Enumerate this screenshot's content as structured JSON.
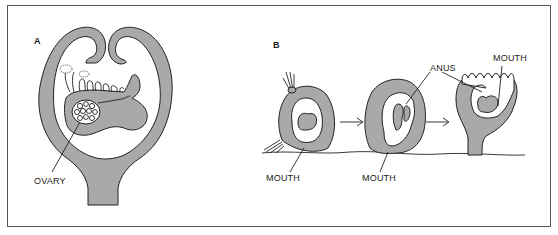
{
  "figure": {
    "panels": [
      {
        "id": "A",
        "label": "A",
        "subject": "sessile organism, cross-section with body cavity",
        "labels": [
          {
            "text": "OVARY"
          }
        ]
      },
      {
        "id": "B",
        "label": "B",
        "subject": "developmental sequence of attached larva (3 stages)",
        "stages": 3,
        "labels": [
          {
            "text": "MOUTH",
            "stage": 1
          },
          {
            "text": "MOUTH",
            "stage": 2
          },
          {
            "text": "ANUS",
            "stage": 3
          },
          {
            "text": "MOUTH",
            "stage": 3
          }
        ],
        "arrows": 2
      }
    ],
    "colors": {
      "fill": "#a9a9a9",
      "stroke": "#222222",
      "frame": "#555555",
      "background": "#ffffff"
    }
  }
}
